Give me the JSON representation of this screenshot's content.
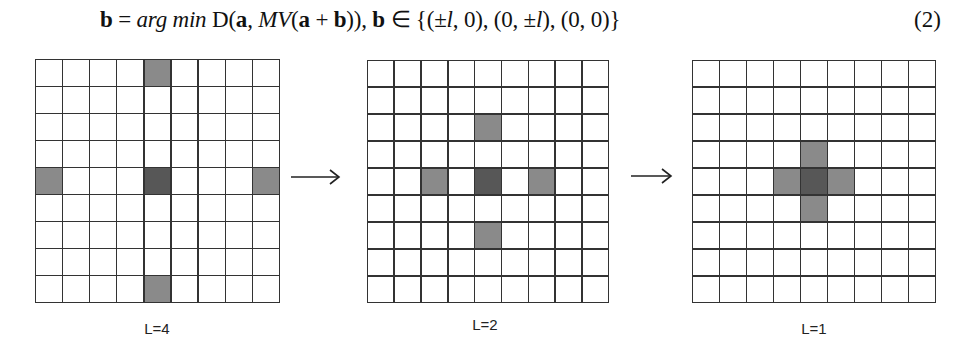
{
  "equation": {
    "lhs": "b",
    "eq": " = ",
    "argmin": "arg min",
    "D": " D(",
    "a": "a",
    "comma": ", ",
    "MV": "MV",
    "open": "(",
    "a2": "a",
    "plus": " + ",
    "b2": "b",
    "close": ")), ",
    "b3": "b",
    "in": " ∈ {(±",
    "l1": "l",
    "s1": ", 0), (0, ±",
    "l2": "l",
    "s2": "), (0, 0)}",
    "number": "(2)"
  },
  "diagram": {
    "grid_size": 9,
    "colors": {
      "line": "#333333",
      "outer": "#8a8a8a",
      "center": "#575757",
      "empty": "#ffffff"
    },
    "panels": [
      {
        "label": "L=4",
        "center": [
          4,
          4
        ],
        "shaded": [
          [
            0,
            4
          ],
          [
            4,
            0
          ],
          [
            4,
            8
          ],
          [
            8,
            4
          ]
        ]
      },
      {
        "label": "L=2",
        "center": [
          4,
          4
        ],
        "shaded": [
          [
            2,
            4
          ],
          [
            4,
            2
          ],
          [
            4,
            6
          ],
          [
            6,
            4
          ]
        ]
      },
      {
        "label": "L=1",
        "center": [
          4,
          4
        ],
        "shaded": [
          [
            3,
            4
          ],
          [
            4,
            3
          ],
          [
            4,
            5
          ],
          [
            5,
            4
          ]
        ]
      }
    ],
    "arrows": [
      "arrow-right",
      "arrow-right"
    ]
  }
}
